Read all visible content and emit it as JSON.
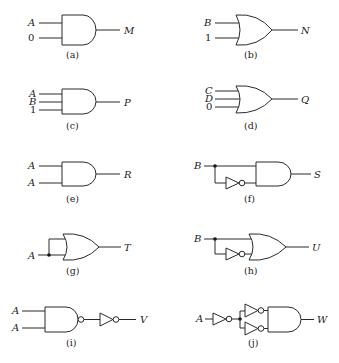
{
  "figure": {
    "circuits": [
      {
        "id": "a",
        "caption": "(a)",
        "gate": "AND",
        "inputs": [
          "A",
          "0"
        ],
        "output": "M"
      },
      {
        "id": "b",
        "caption": "(b)",
        "gate": "OR",
        "inputs": [
          "B",
          "1"
        ],
        "output": "N"
      },
      {
        "id": "c",
        "caption": "(c)",
        "gate": "AND",
        "inputs": [
          "A",
          "B",
          "1"
        ],
        "output": "P"
      },
      {
        "id": "d",
        "caption": "(d)",
        "gate": "OR",
        "inputs": [
          "C",
          "D",
          "0"
        ],
        "output": "Q"
      },
      {
        "id": "e",
        "caption": "(e)",
        "gate": "AND",
        "inputs": [
          "A",
          "A"
        ],
        "output": "R"
      },
      {
        "id": "f",
        "caption": "(f)",
        "gate": "AND",
        "inputs": [
          "B"
        ],
        "extra": "B and NOT B",
        "output": "S"
      },
      {
        "id": "g",
        "caption": "(g)",
        "gate": "OR",
        "inputs": [
          "A"
        ],
        "extra": "A tied to both inputs",
        "output": "T"
      },
      {
        "id": "h",
        "caption": "(h)",
        "gate": "OR",
        "inputs": [
          "B"
        ],
        "extra": "B and NOT B",
        "output": "U"
      },
      {
        "id": "i",
        "caption": "(i)",
        "gate": "NAND",
        "inputs": [
          "A",
          "A"
        ],
        "extra": "followed by NOT",
        "output": "V"
      },
      {
        "id": "j",
        "caption": "(j)",
        "gate": "AND",
        "inputs": [
          "A"
        ],
        "extra": "NOT A split into two NOTs",
        "output": "W"
      }
    ]
  }
}
